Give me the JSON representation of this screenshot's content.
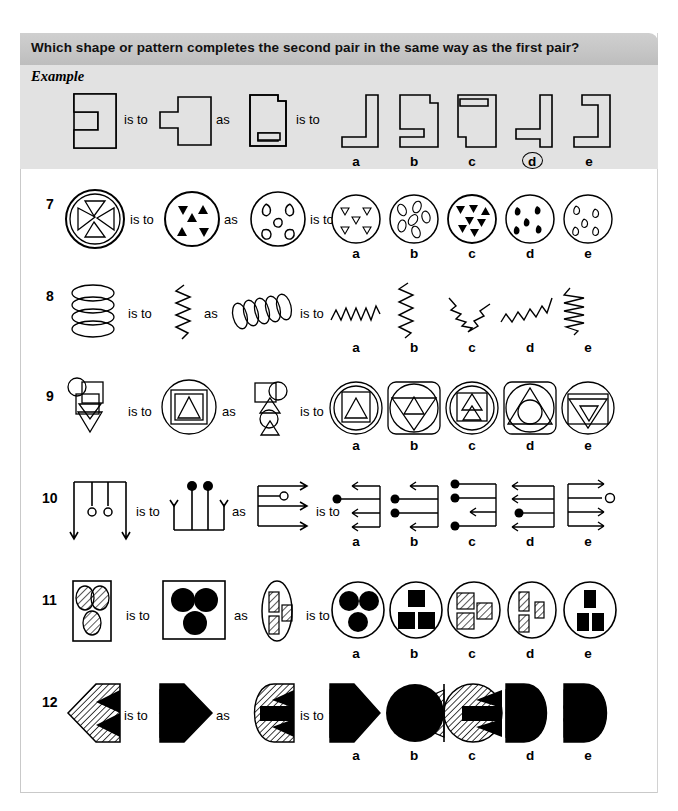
{
  "header": {
    "title": "Which shape or pattern completes the second pair in the same way as the first pair?"
  },
  "example": {
    "label": "Example",
    "connector_is_to": "is to",
    "connector_as": "as",
    "options": [
      "a",
      "b",
      "c",
      "d",
      "e"
    ],
    "answer": "d",
    "answer_circled": true,
    "stimulus_type": "notched-rectangles"
  },
  "connectors": {
    "is_to": "is to",
    "as": "as"
  },
  "option_letters": [
    "a",
    "b",
    "c",
    "d",
    "e"
  ],
  "questions": [
    {
      "number": "7",
      "theme": "circle-with-inner-shapes",
      "options": [
        "a",
        "b",
        "c",
        "d",
        "e"
      ]
    },
    {
      "number": "8",
      "theme": "coil-to-zigzag",
      "options": [
        "a",
        "b",
        "c",
        "d",
        "e"
      ]
    },
    {
      "number": "9",
      "theme": "nested-geometric-shapes",
      "options": [
        "a",
        "b",
        "c",
        "d",
        "e"
      ]
    },
    {
      "number": "10",
      "theme": "lines-arrows-and-dots",
      "options": [
        "a",
        "b",
        "c",
        "d",
        "e"
      ]
    },
    {
      "number": "11",
      "theme": "hatched-to-filled-shapes",
      "options": [
        "a",
        "b",
        "c",
        "d",
        "e"
      ]
    },
    {
      "number": "12",
      "theme": "hatched-chevron-arrows",
      "options": [
        "a",
        "b",
        "c",
        "d",
        "e"
      ]
    }
  ],
  "colors": {
    "header_band": "#c6c6c6",
    "example_band": "#e2e2e2",
    "page_background": "#ffffff",
    "ink": "#000000"
  }
}
